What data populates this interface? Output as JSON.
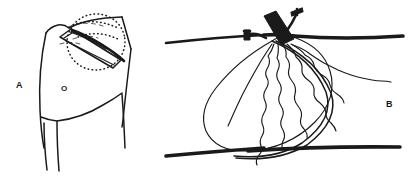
{
  "figure": {
    "width": 409,
    "height": 183,
    "background_color": "#ffffff",
    "ink_color": "#1a1a1a",
    "style": "black-and-white medical line drawing, two panels"
  },
  "panels": [
    {
      "id": "A",
      "label": "A",
      "caption_text": "A",
      "description": "Anatomical line drawing of a torso / flank and groin region with a raised rectangular skin-muscle flap and a dotted oval marking the surgical site",
      "markers": [
        {
          "name": "incision-site-marker",
          "text": "O"
        }
      ],
      "elements": [
        "body-contour-outline",
        "rectangular-flap-strip",
        "dotted-oval-outline",
        "dotted-arc-guides",
        "inguinal-crease-line",
        "thigh-contour-lines"
      ]
    },
    {
      "id": "B",
      "label": "B",
      "caption_text": "B",
      "description": "Detail view showing an implanted device body (dark block) at a tissue plane, with multiple wavy fiber/lead lines radiating into a pear-shaped pocket bounded above and below by tissue-plane lines",
      "elements": [
        "upper-tissue-plane-line",
        "lower-tissue-plane-line",
        "device-body-block",
        "suture-pin-upper",
        "suture-pin-left",
        "pear-shaped-pocket-outline",
        "wavy-lead-fibers",
        "wavy-lead-tail-right",
        "loop-band-lines"
      ]
    }
  ]
}
